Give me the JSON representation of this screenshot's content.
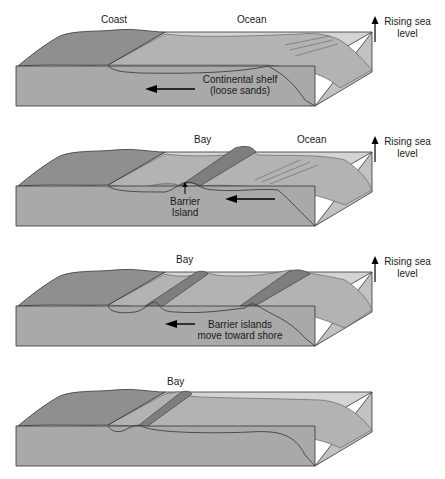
{
  "diagram": {
    "type": "block-diagram-sequence",
    "colors": {
      "front_face": "#a9a9a9",
      "land": "#8f8f8f",
      "shelf_top": "#b3b3b3",
      "water": "#d4d4d4",
      "side_face": "#c2c2c2",
      "island": "#7e7e7e",
      "outline": "#333333"
    },
    "panels": [
      {
        "id": 1,
        "labels": {
          "coast": "Coast",
          "ocean": "Ocean",
          "shelf_line1": "Continental shelf",
          "shelf_line2": "(loose sands)"
        },
        "side_note": {
          "line1": "Rising sea",
          "line2": "level"
        }
      },
      {
        "id": 2,
        "labels": {
          "bay": "Bay",
          "ocean": "Ocean",
          "island_line1": "Barrier",
          "island_line2": "Island"
        },
        "side_note": {
          "line1": "Rising sea",
          "line2": "level"
        }
      },
      {
        "id": 3,
        "labels": {
          "bay": "Bay",
          "move_line1": "Barrier islands",
          "move_line2": "move toward shore"
        },
        "side_note": {
          "line1": "Rising sea",
          "line2": "level"
        }
      },
      {
        "id": 4,
        "labels": {
          "bay": "Bay"
        }
      }
    ]
  }
}
